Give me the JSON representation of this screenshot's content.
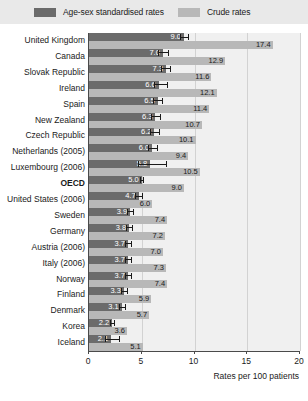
{
  "legend": {
    "entries": [
      {
        "label": "Age-sex standardised rates",
        "color": "#6b6b6b",
        "key": "standardised"
      },
      {
        "label": "Crude rates",
        "color": "#b8b8b8",
        "key": "crude"
      }
    ]
  },
  "axis": {
    "title": "Rates per 100 patients",
    "ticks": [
      "0",
      "5",
      "10",
      "15",
      "20"
    ],
    "min": 0,
    "max": 20
  },
  "chart_data": {
    "type": "bar",
    "orientation": "horizontal",
    "title": "",
    "xlabel": "Rates per 100 patients",
    "ylabel": "",
    "xlim": [
      0,
      20
    ],
    "grid": true,
    "legend_position": "top",
    "categories": [
      "United Kingdom",
      "Canada",
      "Slovak Republic",
      "Ireland",
      "Spain",
      "New Zealand",
      "Czech Republic",
      "Netherlands (2005)",
      "Luxembourg (2006)",
      "OECD",
      "United States (2006)",
      "Sweden",
      "Germany",
      "Austria (2006)",
      "Italy (2006)",
      "Norway",
      "Finland",
      "Denmark",
      "Korea",
      "Iceland"
    ],
    "highlight_category": "OECD",
    "series": [
      {
        "name": "Age-sex standardised rates",
        "key": "standardised",
        "color": "#6b6b6b",
        "values": [
          9.0,
          7.0,
          7.3,
          6.6,
          6.5,
          6.3,
          6.2,
          6.0,
          5.8,
          5.0,
          4.7,
          3.9,
          3.8,
          3.7,
          3.7,
          3.7,
          3.3,
          3.1,
          2.2,
          2.1
        ],
        "error_low": [
          8.6,
          6.5,
          6.8,
          6.2,
          6.1,
          5.9,
          5.8,
          5.6,
          4.6,
          4.8,
          4.4,
          3.6,
          3.5,
          3.4,
          3.4,
          3.4,
          3.0,
          2.8,
          2.0,
          1.5
        ],
        "error_high": [
          9.5,
          7.6,
          7.8,
          7.5,
          7.0,
          6.8,
          6.7,
          6.5,
          7.4,
          5.2,
          5.1,
          4.3,
          4.2,
          4.1,
          4.1,
          4.1,
          3.7,
          3.5,
          2.5,
          2.9
        ]
      },
      {
        "name": "Crude rates",
        "key": "crude",
        "color": "#b8b8b8",
        "values": [
          17.4,
          12.9,
          11.6,
          12.1,
          11.4,
          10.7,
          10.1,
          9.4,
          10.5,
          9.0,
          6.0,
          7.4,
          7.2,
          7.0,
          7.3,
          7.4,
          5.9,
          5.7,
          3.6,
          5.1
        ]
      }
    ]
  }
}
